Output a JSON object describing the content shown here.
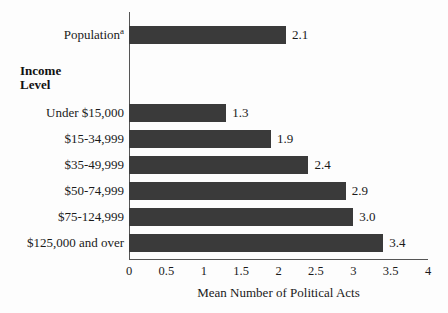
{
  "chart_data": {
    "type": "bar",
    "orientation": "horizontal",
    "title": "",
    "xlabel": "Mean Number of Political Acts",
    "ylabel": "",
    "xlim": [
      0,
      4
    ],
    "xticks": [
      "0",
      "0.5",
      "1",
      "1.5",
      "2",
      "2.5",
      "3",
      "3.5",
      "4"
    ],
    "xtick_values": [
      0,
      0.5,
      1,
      1.5,
      2,
      2.5,
      3,
      3.5,
      4
    ],
    "grid": false,
    "legend": null,
    "bar_color": "#3a3a3a",
    "group_heading": "Income\nLevel",
    "categories": [
      "Population",
      "Under $15,000",
      "$15-34,999",
      "$35-49,999",
      "$50-74,999",
      "$75-124,999",
      "$125,000 and over"
    ],
    "values": [
      2.1,
      1.3,
      1.9,
      2.4,
      2.9,
      3.0,
      3.4
    ],
    "value_labels": [
      "2.1",
      "1.3",
      "1.9",
      "2.4",
      "2.9",
      "3.0",
      "3.4"
    ],
    "bars": [
      {
        "label": "Population",
        "superscript": "a",
        "value": 2.1,
        "value_label": "2.1",
        "group": "overall"
      },
      {
        "label": "Under $15,000",
        "superscript": "",
        "value": 1.3,
        "value_label": "1.3",
        "group": "income"
      },
      {
        "label": "$15-34,999",
        "superscript": "",
        "value": 1.9,
        "value_label": "1.9",
        "group": "income"
      },
      {
        "label": "$35-49,999",
        "superscript": "",
        "value": 2.4,
        "value_label": "2.4",
        "group": "income"
      },
      {
        "label": "$50-74,999",
        "superscript": "",
        "value": 2.9,
        "value_label": "2.9",
        "group": "income"
      },
      {
        "label": "$75-124,999",
        "superscript": "",
        "value": 3.0,
        "value_label": "3.0",
        "group": "income"
      },
      {
        "label": "$125,000 and over",
        "superscript": "",
        "value": 3.4,
        "value_label": "3.4",
        "group": "income"
      }
    ],
    "group_heading_lines": [
      "Income",
      "Level"
    ]
  }
}
